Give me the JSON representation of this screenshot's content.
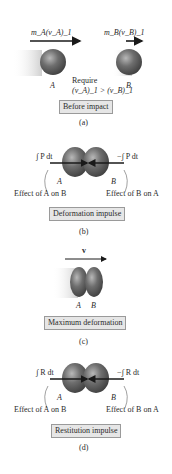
{
  "panels": [
    {
      "id": "a",
      "caption": "(a)",
      "label": "Before impact",
      "momentum_A": "m_A(v_A)_1",
      "momentum_B": "m_B(v_B)_1",
      "require_line1": "Require",
      "require_line2": "(v_A)_1 > (v_B)_1",
      "ball_A": "A",
      "ball_B": "B"
    },
    {
      "id": "b",
      "caption": "(b)",
      "label": "Deformation impulse",
      "impulse_left": "∫ P dt",
      "impulse_right": "−∫ P dt",
      "ball_A": "A",
      "ball_B": "B",
      "effect_left": "Effect of A on B",
      "effect_right": "Effect of B on A"
    },
    {
      "id": "c",
      "caption": "(c)",
      "label": "Maximum deformation",
      "velocity": "v",
      "ball_A": "A",
      "ball_B": "B"
    },
    {
      "id": "d",
      "caption": "(d)",
      "label": "Restitution impulse",
      "impulse_left": "∫ R dt",
      "impulse_right": "−∫ R dt",
      "ball_A": "A",
      "ball_B": "B",
      "effect_left": "Effect of A on B",
      "effect_right": "Effect of B on A"
    }
  ],
  "colors": {
    "ball": "#6b6b6b",
    "ball_highlight": "#b0b0b0",
    "label_bg": "#e6e6e6",
    "label_border": "#9a9a9a",
    "arrow": "#1a1a1a"
  }
}
